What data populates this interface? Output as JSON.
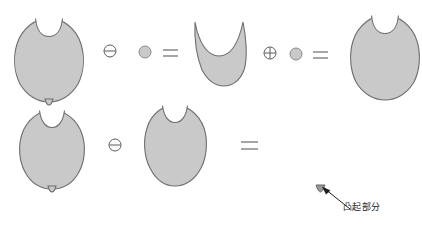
{
  "figure": {
    "title": "",
    "background_color": "#ffffff",
    "shape_fill_color": "#c9c9c9",
    "shape_stroke_color": "#6e6e6e",
    "operator_color": "#4a4a4a",
    "annotation_color": "#1d1d1d"
  },
  "rows": [
    {
      "id": "row-opening",
      "expression": "A ⊖ B = C ⊕ B = D",
      "items": [
        {
          "kind": "shape",
          "name": "original-blob-with-bump",
          "label": "A"
        },
        {
          "kind": "operator",
          "name": "erosion-operator",
          "glyph": "⊖",
          "label": "erosion"
        },
        {
          "kind": "shape",
          "name": "structuring-element-disk",
          "label": "B"
        },
        {
          "kind": "operator",
          "name": "equals-operator",
          "glyph": "=",
          "label": "equals"
        },
        {
          "kind": "shape",
          "name": "eroded-blob",
          "label": "C"
        },
        {
          "kind": "operator",
          "name": "dilation-operator",
          "glyph": "⊕",
          "label": "dilation"
        },
        {
          "kind": "shape",
          "name": "structuring-element-disk",
          "label": "B"
        },
        {
          "kind": "operator",
          "name": "equals-operator",
          "glyph": "=",
          "label": "equals"
        },
        {
          "kind": "shape",
          "name": "opened-blob",
          "label": "D"
        }
      ]
    },
    {
      "id": "row-residue",
      "expression": "A ⊖ D = residue",
      "items": [
        {
          "kind": "shape",
          "name": "original-blob-with-bump",
          "label": "A"
        },
        {
          "kind": "operator",
          "name": "difference-operator",
          "glyph": "⊖",
          "label": "difference"
        },
        {
          "kind": "shape",
          "name": "opened-blob",
          "label": "D"
        },
        {
          "kind": "operator",
          "name": "equals-operator",
          "glyph": "=",
          "label": "equals"
        },
        {
          "kind": "shape",
          "name": "residue-bump",
          "label": "residue"
        }
      ]
    }
  ],
  "operators": {
    "erosion_glyph": "⊖",
    "dilation_glyph": "⊕",
    "equals_glyph": "=",
    "difference_glyph": "⊖"
  },
  "annotation": {
    "name": "protrusion-callout",
    "text": "凸起部分",
    "pointer": "arrow-icon"
  }
}
